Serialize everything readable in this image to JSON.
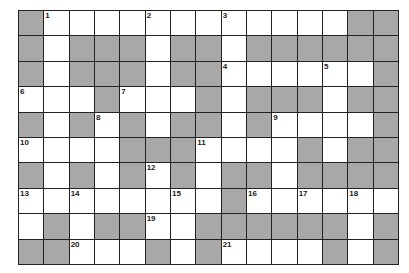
{
  "puzzle": {
    "rows": 10,
    "cols": 15,
    "colors": {
      "block": "#a8a8a8",
      "open": "#ffffff",
      "line": "#222222"
    },
    "layout": [
      "#...........##",
      "#.###.##.######",
      "#.###.##.....#",
      "...#...#.###.##",
      "#.#.#.##.#....#",
      "....###....#.##",
      "#.#.#.#.##.####",
      "........#......",
      ".#.##..######.#",
      "##...#.#....#.#"
    ],
    "grid": [
      [
        "B",
        "1",
        "W",
        "W",
        "W",
        "2",
        "W",
        "W",
        "3",
        "W",
        "W",
        "W",
        "W",
        "B",
        "B"
      ],
      [
        "B",
        "W",
        "B",
        "B",
        "B",
        "W",
        "B",
        "B",
        "W",
        "B",
        "B",
        "B",
        "B",
        "B",
        "B"
      ],
      [
        "B",
        "W",
        "B",
        "B",
        "B",
        "W",
        "B",
        "B",
        "4",
        "W",
        "W",
        "W",
        "5",
        "W",
        "B"
      ],
      [
        "6",
        "W",
        "W",
        "B",
        "7",
        "W",
        "W",
        "B",
        "W",
        "B",
        "B",
        "B",
        "W",
        "B",
        "B"
      ],
      [
        "B",
        "W",
        "B",
        "8",
        "B",
        "W",
        "B",
        "B",
        "W",
        "B",
        "9",
        "W",
        "W",
        "W",
        "B"
      ],
      [
        "10",
        "W",
        "W",
        "W",
        "B",
        "B",
        "B",
        "11",
        "W",
        "W",
        "W",
        "B",
        "W",
        "B",
        "B"
      ],
      [
        "B",
        "W",
        "B",
        "W",
        "B",
        "12",
        "B",
        "W",
        "B",
        "B",
        "W",
        "B",
        "B",
        "B",
        "B"
      ],
      [
        "13",
        "W",
        "14",
        "W",
        "W",
        "W",
        "15",
        "W",
        "B",
        "16",
        "W",
        "17",
        "W",
        "18",
        "W"
      ],
      [
        "W",
        "B",
        "W",
        "B",
        "B",
        "19",
        "W",
        "B",
        "B",
        "B",
        "B",
        "B",
        "B",
        "W",
        "B"
      ],
      [
        "B",
        "B",
        "20",
        "W",
        "W",
        "B",
        "W",
        "B",
        "21",
        "W",
        "W",
        "W",
        "B",
        "W",
        "B"
      ]
    ],
    "clue_numbers": [
      "1",
      "2",
      "3",
      "4",
      "5",
      "6",
      "7",
      "8",
      "9",
      "10",
      "11",
      "12",
      "13",
      "14",
      "15",
      "16",
      "17",
      "18",
      "19",
      "20",
      "21"
    ]
  }
}
